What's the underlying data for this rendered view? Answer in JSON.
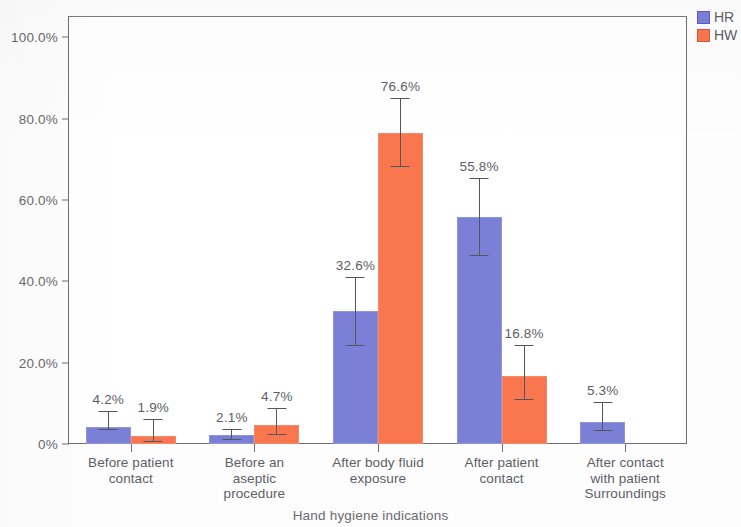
{
  "chart_data": {
    "type": "bar",
    "title": "",
    "xlabel": "Hand hygiene indications",
    "ylabel": "",
    "categories": [
      "Before patient contact",
      "Before an aseptic procedure",
      "After body fluid exposure",
      "After patient contact",
      "After contact with patient Surroundings"
    ],
    "category_lines": [
      [
        "Before patient",
        "contact"
      ],
      [
        "Before an",
        "aseptic",
        "procedure"
      ],
      [
        "After body fluid",
        "exposure"
      ],
      [
        "After patient",
        "contact"
      ],
      [
        "After contact",
        "with patient",
        "Surroundings"
      ]
    ],
    "series": [
      {
        "name": "HR",
        "color": "#7b7fd6",
        "values": [
          4.2,
          2.1,
          32.6,
          55.8,
          5.3
        ],
        "labels": [
          "4.2%",
          "2.1%",
          "32.6%",
          "55.8%",
          "5.3%"
        ],
        "error_low": [
          0.8,
          1.0,
          8.4,
          9.6,
          2.0
        ],
        "error_high": [
          4.0,
          1.5,
          8.4,
          9.6,
          5.0
        ]
      },
      {
        "name": "HW",
        "color": "#f9764f",
        "values": [
          1.9,
          4.7,
          76.6,
          16.8,
          null
        ],
        "labels": [
          "1.9%",
          "4.7%",
          "76.6%",
          "16.8%",
          ""
        ],
        "error_low": [
          1.4,
          2.6,
          8.6,
          6.0,
          null
        ],
        "error_high": [
          4.2,
          4.1,
          8.6,
          7.6,
          null
        ]
      }
    ],
    "ylim": [
      0,
      105
    ],
    "y_ticks": [
      0,
      20,
      40,
      60,
      80,
      100
    ],
    "y_tick_labels": [
      "0%",
      "20.0%",
      "40.0%",
      "60.0%",
      "80.0%",
      "100.0%"
    ],
    "grid": false,
    "legend_position": "top-right"
  },
  "legend": {
    "entries": [
      {
        "label": "HR",
        "color": "#7b7fd6"
      },
      {
        "label": "HW",
        "color": "#f9764f"
      }
    ]
  },
  "axis": {
    "x_title": "Hand hygiene indications"
  }
}
